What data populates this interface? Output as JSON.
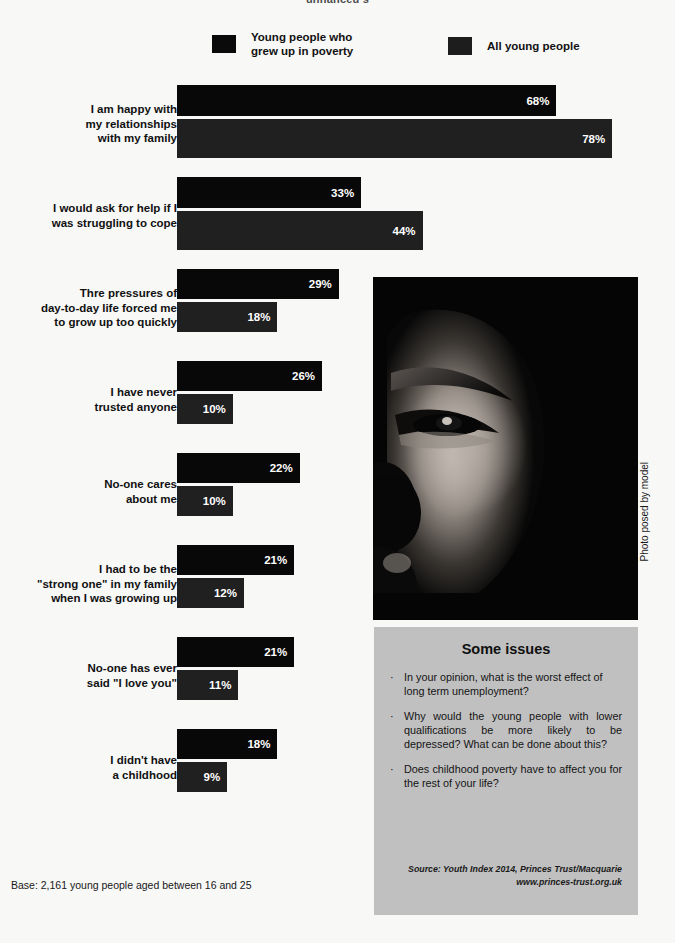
{
  "title_clipped": "unnanceu s",
  "colors": {
    "background": "#f8f8f7",
    "bar_poverty": "#080808",
    "bar_all": "#202020",
    "panel_gray": "#c0c0c0",
    "text": "#111111"
  },
  "legend": {
    "items": [
      {
        "label": "Young people who\ngrew up in poverty",
        "swatch": "black-swatch"
      },
      {
        "label": "All young people",
        "swatch": "black-swatch"
      }
    ]
  },
  "chart_data": {
    "type": "bar",
    "orientation": "horizontal",
    "title": "",
    "xlabel": "",
    "ylabel": "",
    "xlim": [
      0,
      100
    ],
    "grid": false,
    "legend_position": "top",
    "categories": [
      "I am happy with\nmy relationships\nwith my family",
      "I would ask for help if I\nwas struggling to cope",
      "Thre pressures of\nday-to-day life forced me\nto grow up too quickly",
      "I have never\ntrusted anyone",
      "No-one cares\nabout me",
      "I had to be the\n\"strong one\" in my family\nwhen I was growing up",
      "No-one has ever\nsaid \"I love you\"",
      "I didn't have\na childhood"
    ],
    "series": [
      {
        "name": "Young people who grew up in poverty",
        "values": [
          68,
          33,
          29,
          26,
          22,
          21,
          21,
          18
        ],
        "labels": [
          "68%",
          "33%",
          "29%",
          "26%",
          "22%",
          "21%",
          "21%",
          "18%"
        ]
      },
      {
        "name": "All young people",
        "values": [
          78,
          44,
          18,
          10,
          10,
          12,
          11,
          9
        ],
        "labels": [
          "78%",
          "44%",
          "18%",
          "10%",
          "10%",
          "12%",
          "11%",
          "9%"
        ]
      }
    ]
  },
  "photo": {
    "credit": "Photo posed by model",
    "alt": "close-up portrait of a young person's face in shadow"
  },
  "issues_panel": {
    "heading": "Some issues",
    "bullet": "·",
    "items": [
      "In your opinion, what is the worst effect of long term unemployment?",
      "Why would the young people with lower qualifications be more likely to be depressed? What can be done about this?",
      "Does childhood poverty have to affect you for the rest of your life?"
    ],
    "source_line1": "Source: Youth Index 2014, Princes Trust/Macquarie",
    "source_line2": "www.princes-trust.org.uk"
  },
  "base_note": "Base: 2,161 young people aged between 16 and 25"
}
